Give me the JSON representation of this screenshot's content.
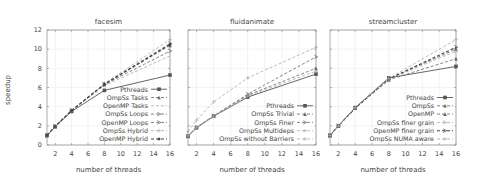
{
  "figure": {
    "ylabel": "speedup",
    "xlabel": "number of threads"
  },
  "chart_data": [
    {
      "type": "line",
      "title": "facesim",
      "xlabel": "number of threads",
      "ylabel": "speedup",
      "x": [
        1,
        2,
        4,
        8,
        16
      ],
      "xticks": [
        2,
        4,
        6,
        8,
        10,
        12,
        14,
        16
      ],
      "yticks": [
        0,
        2,
        4,
        6,
        8,
        10,
        12
      ],
      "xlim": [
        1,
        16
      ],
      "ylim": [
        0,
        12
      ],
      "grid": true,
      "legend_position": "lower right",
      "series": [
        {
          "name": "Pthreads",
          "values": [
            1,
            1.9,
            3.5,
            5.7,
            7.3
          ],
          "style": "solid",
          "marker": "square"
        },
        {
          "name": "OmpSs Tasks",
          "values": [
            1,
            1.95,
            3.6,
            6.3,
            10.4
          ],
          "style": "dashed",
          "marker": "triangle"
        },
        {
          "name": "OpenMP Tasks",
          "values": [
            1,
            1.95,
            3.55,
            6.2,
            9.3
          ],
          "style": "dashed-light",
          "marker": "none"
        },
        {
          "name": "OmpSs Loops",
          "values": [
            1,
            1.95,
            3.6,
            6.35,
            10.6
          ],
          "style": "dashed",
          "marker": "arrow"
        },
        {
          "name": "OpenMP Loops",
          "values": [
            1,
            1.95,
            3.6,
            6.3,
            9.8
          ],
          "style": "dashed",
          "marker": "arrow"
        },
        {
          "name": "OmpSs Hybrid",
          "values": [
            1,
            1.95,
            3.65,
            6.4,
            11.0
          ],
          "style": "dashed-light",
          "marker": "plus"
        },
        {
          "name": "OpenMP Hybrid",
          "values": [
            1,
            1.95,
            3.6,
            6.35,
            10.5
          ],
          "style": "dashed-bold",
          "marker": "diamond"
        }
      ]
    },
    {
      "type": "line",
      "title": "fluidanimate",
      "xlabel": "number of threads",
      "ylabel": "speedup",
      "x": [
        1,
        2,
        4,
        8,
        16
      ],
      "xticks": [
        2,
        4,
        6,
        8,
        10,
        12,
        14,
        16
      ],
      "yticks": [
        0,
        2,
        4,
        6,
        8,
        10,
        12
      ],
      "xlim": [
        1,
        16
      ],
      "ylim": [
        0,
        12
      ],
      "grid": true,
      "legend_position": "lower right",
      "series": [
        {
          "name": "Pthreads",
          "values": [
            0.9,
            1.8,
            3.0,
            5.0,
            7.4
          ],
          "style": "solid",
          "marker": "square"
        },
        {
          "name": "OmpSs Trivial",
          "values": [
            0.95,
            1.85,
            3.0,
            5.2,
            8.0
          ],
          "style": "dashed",
          "marker": "triangle"
        },
        {
          "name": "OmpSs Finer",
          "values": [
            0.95,
            1.85,
            3.05,
            5.3,
            9.2
          ],
          "style": "dashed",
          "marker": "arrow"
        },
        {
          "name": "OmpSs Multideps",
          "values": [
            0.95,
            1.85,
            3.0,
            5.1,
            7.7
          ],
          "style": "dashed-light",
          "marker": "plus"
        },
        {
          "name": "OmpSs without Barriers",
          "values": [
            1.4,
            2.6,
            4.5,
            7.0,
            10.2
          ],
          "style": "dashed-light",
          "marker": "plus"
        }
      ]
    },
    {
      "type": "line",
      "title": "streamcluster",
      "xlabel": "number of threads",
      "ylabel": "speedup",
      "x": [
        1,
        2,
        4,
        8,
        16
      ],
      "xticks": [
        2,
        4,
        6,
        8,
        10,
        12,
        14,
        16
      ],
      "yticks": [
        0,
        2,
        4,
        6,
        8,
        10,
        12
      ],
      "xlim": [
        1,
        16
      ],
      "ylim": [
        0,
        12
      ],
      "grid": true,
      "legend_position": "lower right",
      "series": [
        {
          "name": "Pthreads",
          "values": [
            1,
            2.0,
            3.9,
            7.0,
            8.2
          ],
          "style": "solid",
          "marker": "square"
        },
        {
          "name": "OmpSs",
          "values": [
            1,
            2.0,
            3.85,
            6.8,
            9.0
          ],
          "style": "dashed",
          "marker": "triangle"
        },
        {
          "name": "OpenMP",
          "values": [
            1,
            2.0,
            3.85,
            6.9,
            10.0
          ],
          "style": "dashed",
          "marker": "triangle"
        },
        {
          "name": "OmpSs finer grain",
          "values": [
            1,
            2.0,
            3.85,
            6.85,
            9.8
          ],
          "style": "dashed-light",
          "marker": "arrow"
        },
        {
          "name": "OpenMP finer grain",
          "values": [
            1,
            2.0,
            3.85,
            6.9,
            10.2
          ],
          "style": "dashed-bold",
          "marker": "arrow"
        },
        {
          "name": "OmpSs NUMA aware",
          "values": [
            1,
            2.0,
            3.9,
            6.95,
            11.0
          ],
          "style": "dashed-light",
          "marker": "plus"
        }
      ]
    }
  ]
}
